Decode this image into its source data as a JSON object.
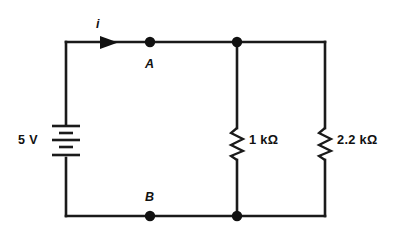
{
  "diagram": {
    "type": "electrical-circuit",
    "line_color": "#1a1a1a",
    "background_color": "#ffffff"
  },
  "source": {
    "name": "battery",
    "label": "5 V",
    "voltage_value": "5",
    "voltage_unit": "V",
    "symbol": "multi-cell-battery"
  },
  "current": {
    "label": "i",
    "direction": "right",
    "arrow": "arrow-right"
  },
  "nodes": [
    {
      "id": "A",
      "label": "A",
      "position": "top-wire"
    },
    {
      "id": "B",
      "label": "B",
      "position": "bottom-wire"
    },
    {
      "id": "J1",
      "label": "",
      "position": "top-junction"
    },
    {
      "id": "J2",
      "label": "",
      "position": "bottom-junction"
    }
  ],
  "resistors": [
    {
      "id": "R1",
      "label": "1 kΩ",
      "value": "1",
      "unit": "kΩ",
      "branch": "middle"
    },
    {
      "id": "R2",
      "label": "2.2 kΩ",
      "value": "2.2",
      "unit": "kΩ",
      "branch": "right"
    }
  ]
}
